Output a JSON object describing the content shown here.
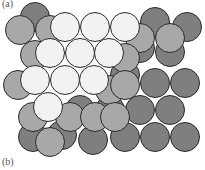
{
  "labels": {
    "a": "(a)",
    "b": "(b)"
  },
  "colors": {
    "layer_a": "#7f7f7f",
    "layer_b": "#a8a8a8",
    "layer_c": "#f2f2f2",
    "stroke": "#2a2a2a",
    "hole": "#ffffff"
  },
  "radius": 14.5,
  "layers": [
    {
      "name": "bottom-dark-layer",
      "fill": "layer_a",
      "spheres": [
        [
          35,
          17
        ],
        [
          155,
          22
        ],
        [
          187,
          27
        ],
        [
          140,
          48
        ],
        [
          170,
          52
        ],
        [
          125,
          75
        ],
        [
          155,
          83
        ],
        [
          185,
          83
        ],
        [
          80,
          110
        ],
        [
          110,
          110
        ],
        [
          140,
          110
        ],
        [
          170,
          110
        ],
        [
          33,
          137
        ],
        [
          93,
          140
        ],
        [
          125,
          137
        ],
        [
          155,
          137
        ],
        [
          185,
          137
        ],
        [
          62,
          135
        ]
      ]
    },
    {
      "name": "middle-gray-layer",
      "fill": "layer_b",
      "spheres": [
        [
          20,
          30
        ],
        [
          50,
          30
        ],
        [
          140,
          38
        ],
        [
          170,
          38
        ],
        [
          35,
          55
        ],
        [
          125,
          58
        ],
        [
          18,
          85
        ],
        [
          110,
          90
        ],
        [
          125,
          85
        ],
        [
          33,
          117
        ],
        [
          70,
          117
        ],
        [
          95,
          117
        ],
        [
          50,
          142
        ],
        [
          115,
          117
        ]
      ]
    },
    {
      "name": "top-white-layer",
      "fill": "layer_c",
      "spheres": [
        [
          65,
          27
        ],
        [
          95,
          27
        ],
        [
          125,
          27
        ],
        [
          50,
          53
        ],
        [
          80,
          53
        ],
        [
          109,
          53
        ],
        [
          35,
          80
        ],
        [
          65,
          80
        ],
        [
          94,
          80
        ],
        [
          48,
          107
        ]
      ]
    }
  ]
}
